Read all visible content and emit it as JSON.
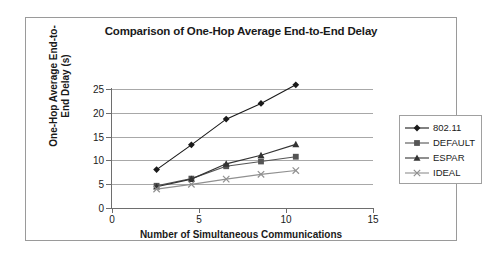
{
  "chart_data": {
    "type": "line",
    "title": "Comparison of One-Hop Average End-to-End Delay",
    "xlabel": "Number of Simultaneous Communications",
    "ylabel": "One-Hop Average End-to-End Delay (s)",
    "ylabel_line1": "One-Hop Average End-to-",
    "ylabel_line2": "End Delay (s)",
    "x": [
      4,
      6,
      8,
      10,
      12
    ],
    "xlim": [
      0,
      15
    ],
    "ylim": [
      0,
      25
    ],
    "xticks": [
      "0",
      "5",
      "10",
      "15"
    ],
    "xtick_values": [
      0,
      5,
      10,
      15
    ],
    "yticks": [
      "0",
      "5",
      "10",
      "15",
      "20",
      "25"
    ],
    "ytick_values": [
      0,
      5,
      10,
      15,
      20,
      25
    ],
    "grid": "horizontal",
    "legend_position": "right",
    "series": [
      {
        "name": "802.11",
        "marker": "diamond",
        "color": "#1a1a1a",
        "values": [
          4.5,
          9.7,
          15.1,
          18.4,
          22.3
        ]
      },
      {
        "name": "DEFAULT",
        "marker": "square",
        "color": "#555555",
        "values": [
          1.1,
          2.6,
          5.2,
          6.2,
          7.2
        ]
      },
      {
        "name": "ESPAR",
        "marker": "triangle",
        "color": "#333333",
        "values": [
          0.9,
          2.5,
          5.7,
          7.5,
          9.8
        ]
      },
      {
        "name": "IDEAL",
        "marker": "cross",
        "color": "#909090",
        "values": [
          0.4,
          1.4,
          2.5,
          3.5,
          4.3
        ]
      }
    ]
  },
  "legend": {
    "entries": [
      {
        "label": "802.11"
      },
      {
        "label": "DEFAULT"
      },
      {
        "label": "ESPAR"
      },
      {
        "label": "IDEAL"
      }
    ]
  }
}
